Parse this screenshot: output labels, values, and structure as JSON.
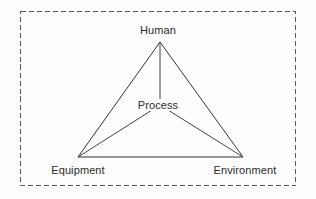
{
  "figure": {
    "name": "human-process-equipment-environment-triangle",
    "background_color": "#fdfdfd",
    "line_color": "#333333",
    "text_color": "#2b2b2b",
    "border": {
      "style": "dashed",
      "color": "#555555",
      "x": 20,
      "y": 11,
      "width": 276,
      "height": 175
    }
  },
  "nodes": {
    "apex": {
      "label": "Human",
      "x": 160,
      "y": 42
    },
    "center": {
      "label": "Process",
      "x": 160,
      "y": 105
    },
    "bottom_left": {
      "label": "Equipment",
      "x": 78,
      "y": 157
    },
    "bottom_right": {
      "label": "Environment",
      "x": 243,
      "y": 157
    }
  },
  "edges": [
    {
      "name": "human-to-equipment",
      "from": "apex",
      "to": "bottom_left"
    },
    {
      "name": "human-to-environment",
      "from": "apex",
      "to": "bottom_right"
    },
    {
      "name": "equipment-to-environment",
      "from": "bottom_left",
      "to": "bottom_right"
    },
    {
      "name": "human-to-process",
      "from": "apex",
      "to": "center"
    },
    {
      "name": "process-to-equipment",
      "from": "center",
      "to": "bottom_left"
    },
    {
      "name": "process-to-environment",
      "from": "center",
      "to": "bottom_right"
    }
  ]
}
